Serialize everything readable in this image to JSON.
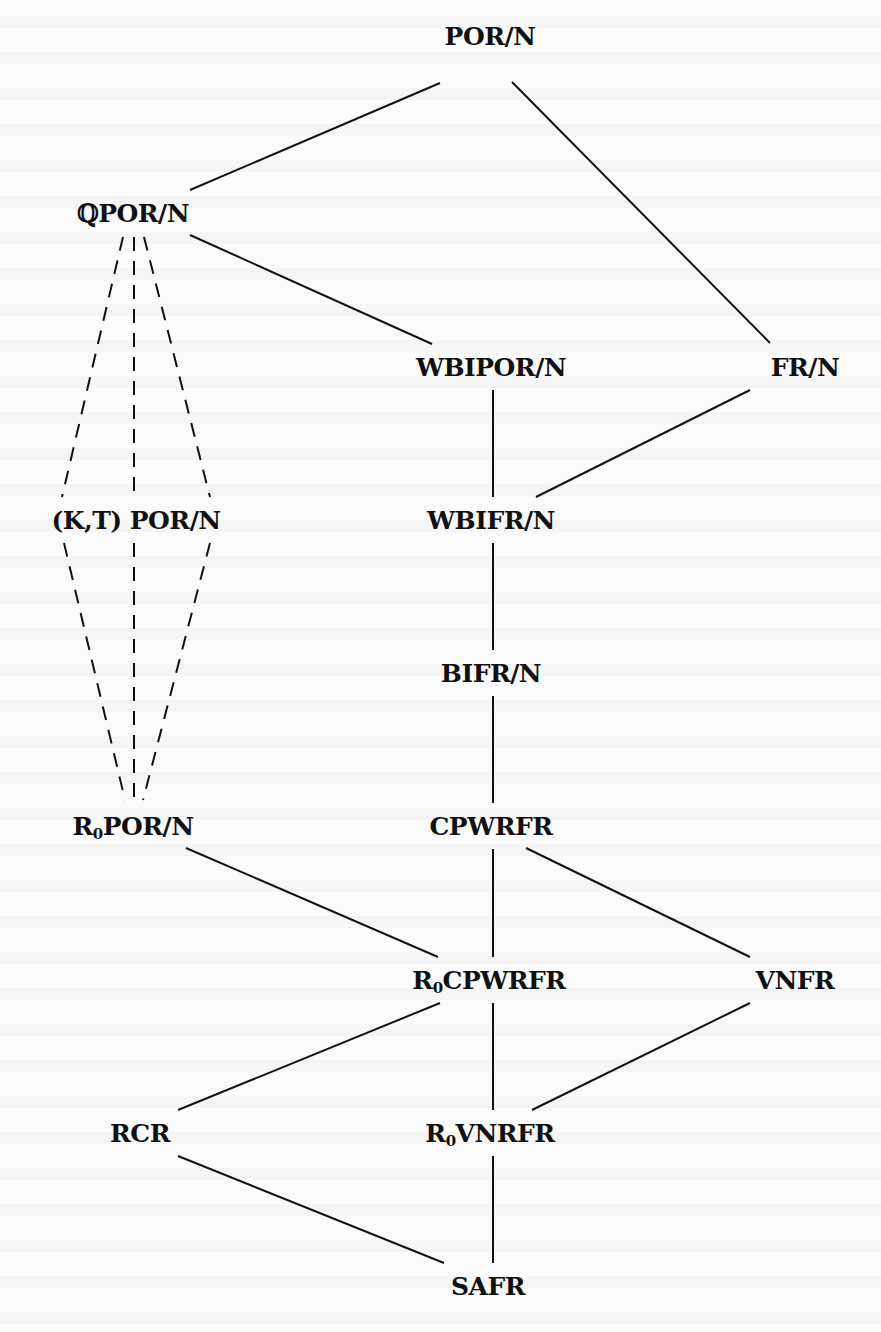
{
  "figure": {
    "type": "hasse-diagram"
  },
  "nodes": [
    {
      "id": "por_n",
      "label": "POR/N",
      "prefix": "",
      "sub": "",
      "rest": "POR/N",
      "x": 490,
      "y": 36
    },
    {
      "id": "qpor_n",
      "label": "ℚPOR/N",
      "prefix": "ℚ",
      "sub": "",
      "rest": "POR/N",
      "x": 133,
      "y": 213
    },
    {
      "id": "wbipor_n",
      "label": "WBIPOR/N",
      "prefix": "",
      "sub": "",
      "rest": "WBIPOR/N",
      "x": 491,
      "y": 367
    },
    {
      "id": "fr_n",
      "label": "FR/N",
      "prefix": "",
      "sub": "",
      "rest": "FR/N",
      "x": 805,
      "y": 367
    },
    {
      "id": "kt_por_n",
      "label": "(K,T) POR/N",
      "prefix": "(K,T) ",
      "sub": "",
      "rest": "POR/N",
      "x": 136,
      "y": 520
    },
    {
      "id": "wbifr_n",
      "label": "WBIFR/N",
      "prefix": "",
      "sub": "",
      "rest": "WBIFR/N",
      "x": 491,
      "y": 520
    },
    {
      "id": "bifr_n",
      "label": "BIFR/N",
      "prefix": "",
      "sub": "",
      "rest": "BIFR/N",
      "x": 491,
      "y": 673
    },
    {
      "id": "r0por_n",
      "label": "R0POR/N",
      "prefix": "R",
      "sub": "0",
      "rest": "POR/N",
      "x": 133,
      "y": 826
    },
    {
      "id": "cpwrfr",
      "label": "CPWRFR",
      "prefix": "",
      "sub": "",
      "rest": "CPWRFR",
      "x": 491,
      "y": 826
    },
    {
      "id": "r0cpwrfr",
      "label": "R0CPWRFR",
      "prefix": "R",
      "sub": "0",
      "rest": "CPWRFR",
      "x": 489,
      "y": 980
    },
    {
      "id": "vnfr",
      "label": "VNFR",
      "prefix": "",
      "sub": "",
      "rest": "VNFR",
      "x": 795,
      "y": 980
    },
    {
      "id": "rcr",
      "label": "RCR",
      "prefix": "",
      "sub": "",
      "rest": "RCR",
      "x": 140,
      "y": 1133
    },
    {
      "id": "r0vnrfr",
      "label": "R0VNRFR",
      "prefix": "R",
      "sub": "0",
      "rest": "VNRFR",
      "x": 490,
      "y": 1133
    },
    {
      "id": "safr",
      "label": "SAFR",
      "prefix": "",
      "sub": "",
      "rest": "SAFR",
      "x": 488,
      "y": 1286
    }
  ],
  "edges": [
    {
      "from": "por_n",
      "to": "qpor_n",
      "style": "solid",
      "x1": 440,
      "y1": 83,
      "x2": 190,
      "y2": 190
    },
    {
      "from": "por_n",
      "to": "fr_n",
      "style": "solid",
      "x1": 512,
      "y1": 82,
      "x2": 770,
      "y2": 343
    },
    {
      "from": "qpor_n",
      "to": "wbipor_n",
      "style": "solid",
      "x1": 190,
      "y1": 235,
      "x2": 432,
      "y2": 344
    },
    {
      "from": "qpor_n",
      "to": "kt_por_n",
      "style": "dashed",
      "x1": 123,
      "y1": 237,
      "x2": 62,
      "y2": 497
    },
    {
      "from": "qpor_n",
      "to": "kt_por_n",
      "style": "dashed",
      "x1": 134,
      "y1": 237,
      "x2": 134,
      "y2": 497
    },
    {
      "from": "qpor_n",
      "to": "kt_por_n",
      "style": "dashed",
      "x1": 144,
      "y1": 237,
      "x2": 210,
      "y2": 497
    },
    {
      "from": "kt_por_n",
      "to": "r0por_n",
      "style": "dashed",
      "x1": 64,
      "y1": 543,
      "x2": 125,
      "y2": 800
    },
    {
      "from": "kt_por_n",
      "to": "r0por_n",
      "style": "dashed",
      "x1": 134,
      "y1": 543,
      "x2": 134,
      "y2": 800
    },
    {
      "from": "kt_por_n",
      "to": "r0por_n",
      "style": "dashed",
      "x1": 210,
      "y1": 543,
      "x2": 143,
      "y2": 800
    },
    {
      "from": "wbipor_n",
      "to": "wbifr_n",
      "style": "solid",
      "x1": 493,
      "y1": 390,
      "x2": 493,
      "y2": 497
    },
    {
      "from": "fr_n",
      "to": "wbifr_n",
      "style": "solid",
      "x1": 750,
      "y1": 390,
      "x2": 536,
      "y2": 497
    },
    {
      "from": "wbifr_n",
      "to": "bifr_n",
      "style": "solid",
      "x1": 493,
      "y1": 543,
      "x2": 493,
      "y2": 650
    },
    {
      "from": "bifr_n",
      "to": "cpwrfr",
      "style": "solid",
      "x1": 493,
      "y1": 696,
      "x2": 493,
      "y2": 803
    },
    {
      "from": "r0por_n",
      "to": "r0cpwrfr",
      "style": "solid",
      "x1": 186,
      "y1": 848,
      "x2": 438,
      "y2": 957
    },
    {
      "from": "cpwrfr",
      "to": "r0cpwrfr",
      "style": "solid",
      "x1": 493,
      "y1": 849,
      "x2": 493,
      "y2": 957
    },
    {
      "from": "cpwrfr",
      "to": "vnfr",
      "style": "solid",
      "x1": 526,
      "y1": 848,
      "x2": 750,
      "y2": 957
    },
    {
      "from": "r0cpwrfr",
      "to": "rcr",
      "style": "solid",
      "x1": 440,
      "y1": 1003,
      "x2": 178,
      "y2": 1110
    },
    {
      "from": "r0cpwrfr",
      "to": "r0vnrfr",
      "style": "solid",
      "x1": 493,
      "y1": 1003,
      "x2": 493,
      "y2": 1110
    },
    {
      "from": "vnfr",
      "to": "r0vnrfr",
      "style": "solid",
      "x1": 750,
      "y1": 1003,
      "x2": 532,
      "y2": 1110
    },
    {
      "from": "rcr",
      "to": "safr",
      "style": "solid",
      "x1": 178,
      "y1": 1156,
      "x2": 444,
      "y2": 1263
    },
    {
      "from": "r0vnrfr",
      "to": "safr",
      "style": "solid",
      "x1": 493,
      "y1": 1156,
      "x2": 493,
      "y2": 1263
    }
  ]
}
